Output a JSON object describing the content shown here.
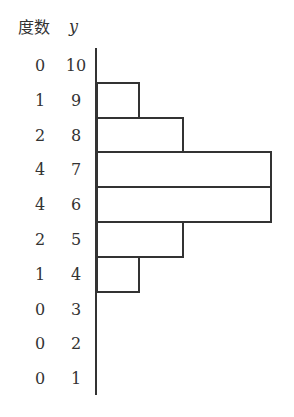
{
  "header": {
    "freq_label": "度数",
    "y_label": "y"
  },
  "chart_data": {
    "type": "bar",
    "orientation": "horizontal",
    "title": "",
    "xlabel": "度数",
    "ylabel": "y",
    "categories": [
      "10",
      "9",
      "8",
      "7",
      "6",
      "5",
      "4",
      "3",
      "2",
      "1"
    ],
    "values": [
      0,
      1,
      2,
      4,
      4,
      2,
      1,
      0,
      0,
      0
    ],
    "grid": false,
    "legend": null
  },
  "rows": [
    {
      "freq": "0",
      "y": "10",
      "value": 0
    },
    {
      "freq": "1",
      "y": "9",
      "value": 1
    },
    {
      "freq": "2",
      "y": "8",
      "value": 2
    },
    {
      "freq": "4",
      "y": "7",
      "value": 4
    },
    {
      "freq": "4",
      "y": "6",
      "value": 4
    },
    {
      "freq": "2",
      "y": "5",
      "value": 2
    },
    {
      "freq": "1",
      "y": "4",
      "value": 1
    },
    {
      "freq": "0",
      "y": "3",
      "value": 0
    },
    {
      "freq": "0",
      "y": "2",
      "value": 0
    },
    {
      "freq": "0",
      "y": "1",
      "value": 0
    }
  ]
}
